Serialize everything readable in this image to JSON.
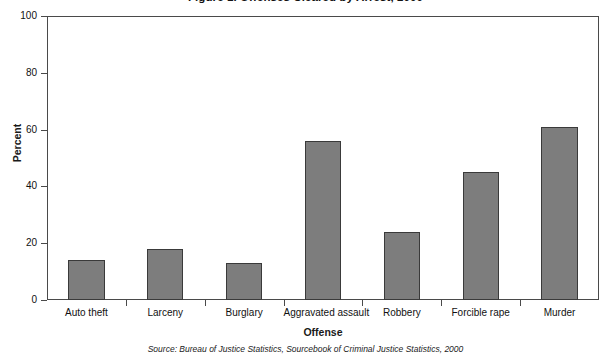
{
  "chart_data": {
    "type": "bar",
    "title": "Figure 1. Offenses Cleared by Arrest, 2000",
    "xlabel": "Offense",
    "ylabel": "Percent",
    "ylim": [
      0,
      100
    ],
    "yticks": [
      0,
      20,
      40,
      60,
      80,
      100
    ],
    "grid": false,
    "legend": null,
    "categories": [
      "Auto theft",
      "Larceny",
      "Burglary",
      "Aggravated assault",
      "Robbery",
      "Forcible rape",
      "Murder"
    ],
    "values": [
      14,
      18,
      13,
      56,
      24,
      45,
      61
    ],
    "bar_color": "#7d7d7d",
    "bar_edge_color": "#3a3a3a",
    "axis_color": "#4a4a4a",
    "source": "Source: Bureau of Justice Statistics, Sourcebook of Criminal Justice Statistics, 2000"
  }
}
